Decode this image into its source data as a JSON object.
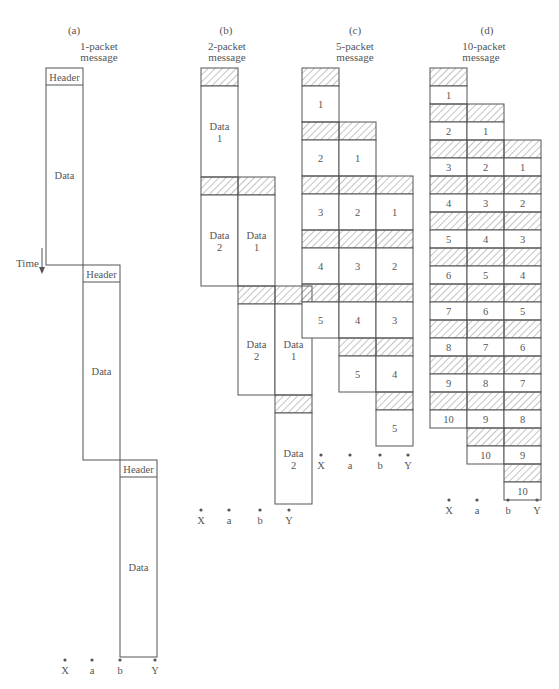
{
  "figure": {
    "time_label": "Time",
    "header_label": "Header",
    "data_label": "Data",
    "node_labels": [
      "X",
      "a",
      "b",
      "Y"
    ],
    "colors": {
      "line": "#555555",
      "hatch": "#777777",
      "text": "#555555",
      "background": "#ffffff"
    }
  },
  "panels": [
    {
      "id": "a",
      "tag": "(a)",
      "title_line1": "1-packet",
      "title_line2": "message",
      "packets": 1
    },
    {
      "id": "b",
      "tag": "(b)",
      "title_line1": "2-packet",
      "title_line2": "message",
      "packets": 2
    },
    {
      "id": "c",
      "tag": "(c)",
      "title_line1": "5-packet",
      "title_line2": "message",
      "packets": 5
    },
    {
      "id": "d",
      "tag": "(d)",
      "title_line1": "10-packet",
      "title_line2": "message",
      "packets": 10
    }
  ],
  "panel_a": {
    "hops": [
      {
        "header": "Header",
        "data": "Data"
      },
      {
        "header": "Header",
        "data": "Data"
      },
      {
        "header": "Header",
        "data": "Data"
      }
    ]
  },
  "panel_b": {
    "cells": [
      [
        "Data 1",
        "",
        ""
      ],
      [
        "Data 2",
        "Data 1",
        ""
      ],
      [
        "",
        "Data 2",
        "Data 1"
      ],
      [
        "",
        "",
        "Data 2"
      ]
    ]
  },
  "panel_c": {
    "cells": [
      [
        "1",
        "",
        ""
      ],
      [
        "2",
        "1",
        ""
      ],
      [
        "3",
        "2",
        "1"
      ],
      [
        "4",
        "3",
        "2"
      ],
      [
        "5",
        "4",
        "3"
      ],
      [
        "",
        "5",
        "4"
      ],
      [
        "",
        "",
        "5"
      ]
    ]
  },
  "panel_d": {
    "cells": [
      [
        "1",
        "",
        ""
      ],
      [
        "2",
        "1",
        ""
      ],
      [
        "3",
        "2",
        "1"
      ],
      [
        "4",
        "3",
        "2"
      ],
      [
        "5",
        "4",
        "3"
      ],
      [
        "6",
        "5",
        "4"
      ],
      [
        "7",
        "6",
        "5"
      ],
      [
        "8",
        "7",
        "6"
      ],
      [
        "9",
        "8",
        "7"
      ],
      [
        "10",
        "9",
        "8"
      ],
      [
        "",
        "10",
        "9"
      ],
      [
        "",
        "",
        "10"
      ]
    ]
  }
}
